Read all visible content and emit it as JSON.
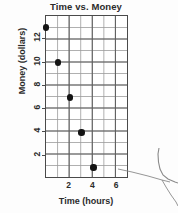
{
  "chart_data": {
    "type": "scatter",
    "title": "Time vs. Money",
    "xlabel": "Time (hours)",
    "ylabel": "Money (dollars)",
    "x": [
      0,
      1,
      2,
      3,
      4
    ],
    "values": [
      13,
      10,
      7,
      4,
      1
    ],
    "points": [
      {
        "x": 0,
        "y": 13
      },
      {
        "x": 1,
        "y": 10
      },
      {
        "x": 2,
        "y": 7
      },
      {
        "x": 3,
        "y": 4
      },
      {
        "x": 4,
        "y": 1
      }
    ],
    "xlim": [
      0,
      7
    ],
    "ylim": [
      0,
      14
    ],
    "xticks": [
      2,
      4,
      6
    ],
    "xtick_labels": [
      "2",
      "4",
      "6"
    ],
    "yticks": [
      2,
      4,
      6,
      8,
      10,
      12
    ],
    "ytick_labels": [
      "2",
      "4",
      "6",
      "8",
      "10",
      "12"
    ],
    "grid": true,
    "grid_minor": true,
    "grid_x_step": 1,
    "grid_y_step": 1,
    "legend": null,
    "marker": "filled-circle",
    "marker_color": "#141414",
    "grid_color": "#9a9a9a",
    "grid_major_color": "#5f5f5f",
    "frame_color": "#4a4a4a"
  },
  "artifact": {
    "name": "scan-edge-artifact",
    "color": "#7a7a7a"
  }
}
